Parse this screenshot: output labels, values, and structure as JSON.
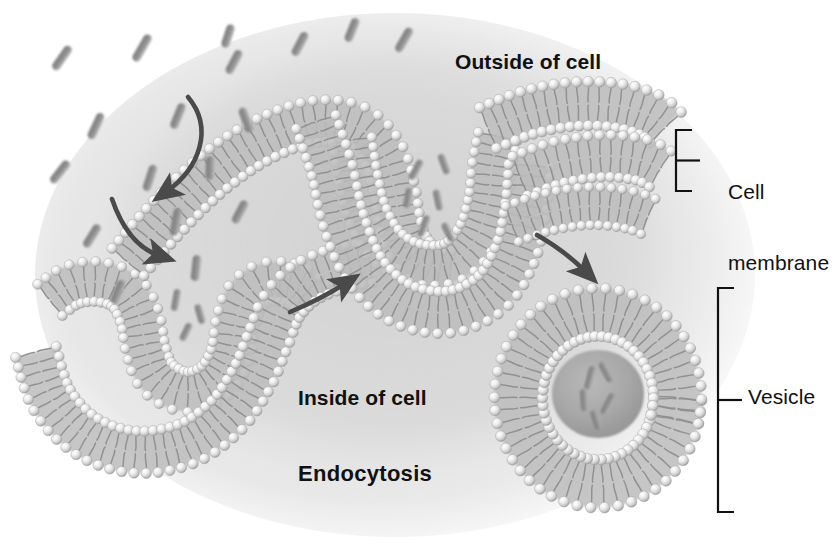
{
  "diagram": {
    "title": "Endocytosis",
    "type": "cell-biology-illustration",
    "background_color": "#ffffff",
    "cell_tint_color": "#d8d8d8",
    "membrane_head_color": "#e6e6e6",
    "membrane_tail_color": "#8f8f8f",
    "particle_color": "#9a9a9a",
    "arrow_color": "#4a4a4a",
    "label_color": "#111111"
  },
  "labels": {
    "outside": "Outside of cell",
    "inside": "Inside of cell",
    "process": "Endocytosis",
    "cell_membrane_line1": "Cell",
    "cell_membrane_line2": "membrane",
    "vesicle": "Vesicle"
  },
  "brackets": [
    {
      "name": "cell-membrane-bracket",
      "x": 676,
      "y_top": 130,
      "y_bottom": 191,
      "tick_x": 700
    },
    {
      "name": "vesicle-bracket",
      "x": 718,
      "y_top": 288,
      "y_bottom": 512,
      "tick_x": 742
    }
  ],
  "arrows": [
    {
      "name": "particle-entry-arrow-1",
      "direction": "down-right",
      "from": [
        188,
        97
      ],
      "to": [
        161,
        196
      ]
    },
    {
      "name": "particle-entry-arrow-2",
      "direction": "down-right",
      "from": [
        112,
        199
      ],
      "to": [
        163,
        260
      ]
    },
    {
      "name": "progression-arrow-left-to-center",
      "direction": "up-right",
      "from": [
        290,
        312
      ],
      "to": [
        350,
        281
      ]
    },
    {
      "name": "progression-arrow-center-to-vesicle",
      "direction": "down-right",
      "from": [
        537,
        235
      ],
      "to": [
        590,
        276
      ]
    }
  ],
  "structures": [
    {
      "name": "membrane-invagination-left",
      "stage": "early-pocket",
      "center": [
        160,
        330
      ]
    },
    {
      "name": "membrane-invagination-center",
      "stage": "deep-pocket-pinching",
      "center": [
        430,
        230
      ]
    },
    {
      "name": "membrane-flat-right",
      "stage": "intact-bilayer",
      "span_x": [
        470,
        660
      ]
    },
    {
      "name": "vesicle-free",
      "stage": "released-vesicle",
      "center": [
        598,
        398
      ],
      "radius": 108
    }
  ],
  "particles": {
    "name": "extracellular-particles",
    "shape": "rod",
    "count_outside": 14,
    "count_in_center_pocket": 6,
    "count_in_vesicle": 5,
    "count_in_left_pocket": 3
  }
}
